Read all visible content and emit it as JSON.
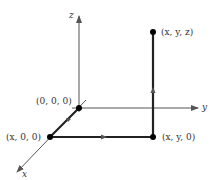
{
  "diagram": {
    "title": "",
    "axes": {
      "x_label": "x",
      "y_label": "y",
      "z_label": "z"
    },
    "points": [
      {
        "id": "origin",
        "label": "(0, 0, 0)",
        "pos": [
          79,
          108
        ]
      },
      {
        "id": "x00",
        "label": "(x, 0, 0)",
        "pos": [
          50,
          137
        ]
      },
      {
        "id": "xy0",
        "label": "(x, y, 0)",
        "pos": [
          153,
          137
        ]
      },
      {
        "id": "xyz",
        "label": "(x, y, z)",
        "pos": [
          153,
          32
        ]
      }
    ],
    "path": [
      "origin",
      "x00",
      "xy0",
      "xyz"
    ],
    "colors": {
      "axis": "#555555",
      "path": "#222222",
      "point": "#000000"
    }
  }
}
